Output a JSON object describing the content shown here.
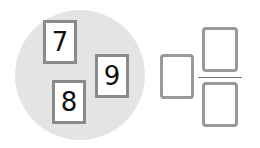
{
  "cards": [
    {
      "digit": "7"
    },
    {
      "digit": "9"
    },
    {
      "digit": "8"
    }
  ],
  "answer": {
    "whole_box": "",
    "numerator_box": "",
    "denominator_box": ""
  }
}
